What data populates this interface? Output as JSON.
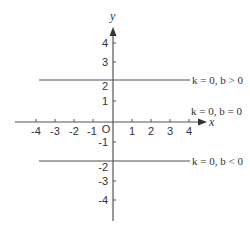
{
  "diagram": {
    "axes": {
      "x_label": "x",
      "y_label": "y",
      "origin_label": "O",
      "x_ticks": [
        "-4",
        "-3",
        "-2",
        "-1",
        "1",
        "2",
        "3",
        "4"
      ],
      "y_ticks": [
        "4",
        "3",
        "2",
        "1",
        "-1",
        "-2",
        "-3",
        "-4"
      ]
    },
    "lines": [
      {
        "name": "positive-b",
        "y_value": 2.1,
        "label": "k = 0, b > 0"
      },
      {
        "name": "zero-b",
        "y_value": 0,
        "label": "k = 0, b = 0"
      },
      {
        "name": "negative-b",
        "y_value": -2,
        "label": "k = 0, b < 0"
      }
    ],
    "colors": {
      "axis": "#444444",
      "line": "#888888",
      "text": "#333333"
    }
  }
}
